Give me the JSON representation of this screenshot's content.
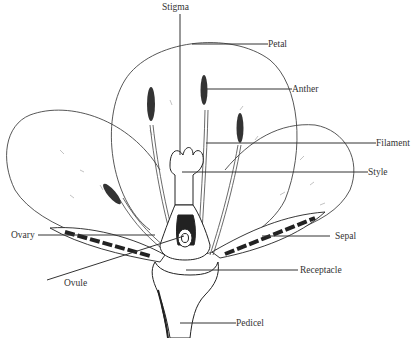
{
  "diagram": {
    "labels": {
      "stigma": "Stigma",
      "petal": "Petal",
      "anther": "Anther",
      "filament": "Filament",
      "style": "Style",
      "ovary": "Ovary",
      "sepal": "Sepal",
      "ovule": "Ovule",
      "receptacle": "Receptacle",
      "pedicel": "Pedicel"
    }
  }
}
